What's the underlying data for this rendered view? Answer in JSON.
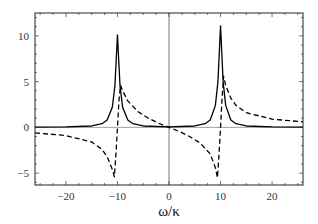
{
  "chart_data": {
    "type": "line",
    "title": "",
    "xlabel": "ω/κ",
    "ylabel": "",
    "xlim": [
      -26,
      26
    ],
    "ylim": [
      -6.3,
      12.5
    ],
    "xticks": [
      -20,
      -10,
      0,
      10,
      20
    ],
    "xtick_labels": [
      "−20",
      "−10",
      "0",
      "10",
      "20"
    ],
    "yticks": [
      -5,
      0,
      5,
      10
    ],
    "ytick_labels": [
      "−5",
      "0",
      "5",
      "10"
    ],
    "grid": false,
    "frame": true,
    "reference_lines": {
      "horizontal_y": 0,
      "vertical_x": 0
    },
    "series": [
      {
        "name": "absorptive (solid)",
        "style": "solid",
        "color": "#000000",
        "peaks": [
          {
            "x": -10,
            "y": 10.1
          },
          {
            "x": 10,
            "y": 11.1
          }
        ],
        "x": [
          -26,
          -20,
          -15,
          -13,
          -12,
          -11,
          -10.5,
          -10,
          -9.5,
          -9,
          -8,
          -7,
          -5,
          0,
          5,
          7,
          8,
          9,
          9.5,
          10,
          10.5,
          11,
          12,
          13,
          15,
          20,
          26
        ],
        "values": [
          0.03,
          0.05,
          0.15,
          0.4,
          0.8,
          2.2,
          4.5,
          10.1,
          4.5,
          2.2,
          0.8,
          0.4,
          0.15,
          0.05,
          0.15,
          0.4,
          0.8,
          2.4,
          5.0,
          11.1,
          5.0,
          2.4,
          0.8,
          0.4,
          0.15,
          0.05,
          0.03
        ]
      },
      {
        "name": "dispersive (dashed)",
        "style": "dashed",
        "color": "#000000",
        "x": [
          -26,
          -20,
          -15,
          -13,
          -12,
          -11,
          -10.6,
          -10.3,
          -10,
          -9.7,
          -9.4,
          -9,
          -8,
          -6,
          -4,
          -2,
          0,
          2,
          4,
          6,
          8,
          9,
          9.4,
          9.7,
          10,
          10.3,
          10.6,
          11,
          12,
          13,
          15,
          20,
          26
        ],
        "values": [
          -0.6,
          -0.9,
          -1.6,
          -2.4,
          -3.2,
          -4.6,
          -5.4,
          -3.0,
          0.0,
          3.0,
          4.6,
          4.0,
          2.9,
          1.7,
          1.0,
          0.45,
          0.0,
          -0.45,
          -1.0,
          -1.7,
          -2.9,
          -4.4,
          -5.5,
          -3.0,
          0.0,
          3.2,
          5.6,
          4.6,
          3.2,
          2.4,
          1.6,
          0.9,
          0.6
        ]
      }
    ]
  }
}
